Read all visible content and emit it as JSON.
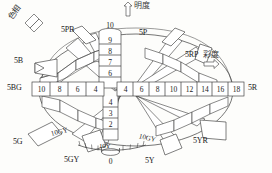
{
  "diagram": {
    "title_hidden": "Munsell color solid diagram",
    "axis_labels": {
      "hue": "色相",
      "value": "明度",
      "chroma": "彩度",
      "hue_arrow": "arrow-hue",
      "value_arrow": "arrow-up",
      "chroma_arrow": "arrow-right"
    },
    "value_axis": {
      "name": "value-axis",
      "top_label": "10",
      "upper_steps": [
        "9",
        "8",
        "7",
        "6"
      ],
      "lower_steps": [
        "4",
        "3",
        "2"
      ],
      "bottom_label": "0"
    },
    "chroma_axis": {
      "left_label": "5BG",
      "right_label": "5R",
      "left_values": [
        "10",
        "8",
        "6",
        "4"
      ],
      "right_values": [
        "4",
        "6",
        "8",
        "10",
        "12",
        "14",
        "16",
        "18"
      ]
    },
    "hue_labels": [
      {
        "id": "5PB",
        "text": "5PB"
      },
      {
        "id": "5P",
        "text": "5P"
      },
      {
        "id": "5RP",
        "text": "5RP"
      },
      {
        "id": "5B",
        "text": "5B"
      },
      {
        "id": "5G",
        "text": "5G"
      },
      {
        "id": "5GY",
        "text": "5GY"
      },
      {
        "id": "5Y",
        "text": "5Y"
      },
      {
        "id": "5YR",
        "text": "5YR"
      }
    ],
    "inner_labels": [
      {
        "id": "10GY-left",
        "text": "10GY"
      },
      {
        "id": "10GY-right",
        "text": "10GY"
      },
      {
        "id": "10Y",
        "text": "10Y"
      }
    ],
    "colors": {
      "line": "#3b3b3b",
      "fill": "#ffffff",
      "background": "#fdfdfb",
      "text": "#1a1a1a"
    }
  }
}
